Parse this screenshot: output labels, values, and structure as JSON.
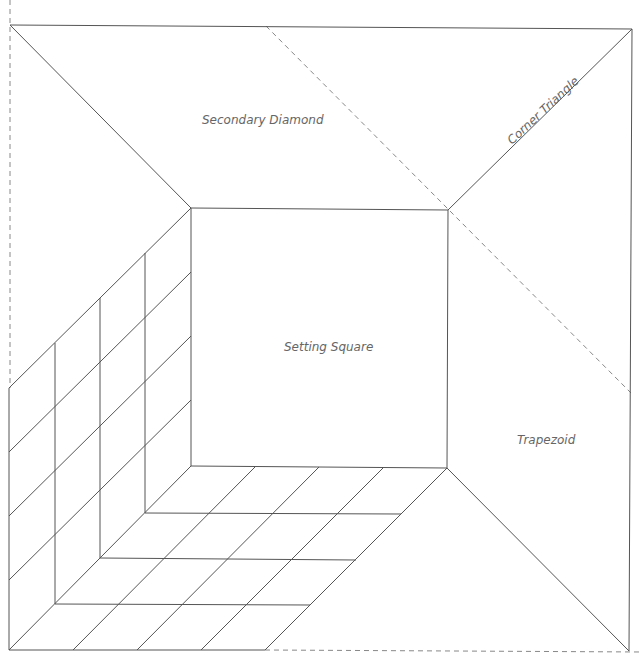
{
  "diagram": {
    "title": "",
    "stroke_color": "#555555",
    "dash_color": "#888888",
    "label_color": "#666666",
    "labels": {
      "secondary_diamond": "Secondary Diamond",
      "corner_triangle": "Corner Triangle",
      "setting_square": "Setting Square",
      "trapezoid": "Trapezoid"
    },
    "regions": [
      {
        "name": "Secondary Diamond",
        "shape": "trapezoid (top)"
      },
      {
        "name": "Corner Triangle",
        "shape": "triangle (top-right)"
      },
      {
        "name": "Setting Square",
        "shape": "square (center)"
      },
      {
        "name": "Trapezoid",
        "shape": "trapezoid (right)"
      },
      {
        "name": "Left wall grid",
        "shape": "4x4 sheared grid"
      },
      {
        "name": "Floor grid",
        "shape": "4x4 sheared grid"
      }
    ]
  }
}
